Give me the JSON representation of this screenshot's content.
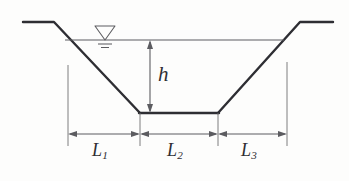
{
  "figure": {
    "type": "engineering-cross-section-diagram",
    "background_color": "#fdfdfc",
    "line_color": "#2e2e33",
    "thin_line_color": "#6f6f72",
    "labels": {
      "depth": {
        "symbol": "h",
        "subscript": ""
      },
      "left_slope_width": {
        "symbol": "L",
        "subscript": "1"
      },
      "bottom_width": {
        "symbol": "L",
        "subscript": "2"
      },
      "right_slope_width": {
        "symbol": "L",
        "subscript": "3"
      }
    },
    "symbols": {
      "water_surface": "water-level-triangle-icon"
    },
    "geometry": {
      "left_bank_top_y": 22,
      "left_bank_top_x_start": 23,
      "left_bank_top_x_end": 54,
      "left_slope_bottom_x": 140,
      "channel_bottom_y": 113,
      "right_slope_bottom_x": 218,
      "right_bank_top_x_start": 300,
      "right_bank_top_x_end": 333,
      "water_surface_y": 40,
      "water_surface_x_start": 65,
      "water_surface_x_end": 283,
      "depth_arrow_x": 150,
      "dimension_line_y": 134,
      "extension_line_x_left": 68,
      "extension_line_x_mid_left": 140,
      "extension_line_x_mid_right": 218,
      "extension_line_x_right": 287,
      "water_symbol_center_x": 105
    }
  }
}
